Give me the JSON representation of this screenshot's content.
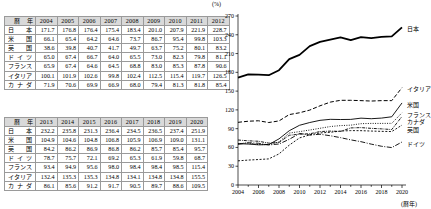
{
  "table_top": {
    "header": [
      "暦　年",
      "2004",
      "2005",
      "2006",
      "2007",
      "2008",
      "2009",
      "2010",
      "2011",
      "2012"
    ],
    "rows": [
      {
        "country": "日本",
        "values": [
          "171.7",
          "176.8",
          "176.4",
          "175.4",
          "183.4",
          "201.0",
          "207.9",
          "221.9",
          "228.7"
        ]
      },
      {
        "country": "米国",
        "values": [
          "66.1",
          "65.4",
          "64.2",
          "64.6",
          "73.7",
          "86.7",
          "95.4",
          "99.8",
          "103.3"
        ]
      },
      {
        "country": "英国",
        "values": [
          "38.6",
          "39.8",
          "40.7",
          "41.7",
          "49.7",
          "63.7",
          "75.2",
          "80.1",
          "83.2"
        ]
      },
      {
        "country": "ドイツ",
        "values": [
          "65.0",
          "67.4",
          "66.7",
          "64.0",
          "65.5",
          "73.0",
          "82.3",
          "79.8",
          "81.1"
        ]
      },
      {
        "country": "フランス",
        "values": [
          "65.9",
          "67.4",
          "64.6",
          "64.5",
          "68.8",
          "83.0",
          "85.3",
          "87.8",
          "90.6"
        ]
      },
      {
        "country": "イタリア",
        "values": [
          "100.1",
          "101.9",
          "102.6",
          "99.8",
          "102.4",
          "112.5",
          "115.4",
          "119.7",
          "126.5"
        ]
      },
      {
        "country": "カナダ",
        "values": [
          "71.9",
          "70.6",
          "69.9",
          "66.9",
          "68.0",
          "79.4",
          "81.3",
          "81.8",
          "85.4"
        ]
      }
    ]
  },
  "table_bottom": {
    "header": [
      "暦　年",
      "2013",
      "2014",
      "2015",
      "2016",
      "2017",
      "2018",
      "2019",
      "2020"
    ],
    "rows": [
      {
        "country": "日本",
        "values": [
          "232.2",
          "235.8",
          "231.3",
          "236.4",
          "234.5",
          "236.5",
          "237.4",
          "251.9"
        ]
      },
      {
        "country": "米国",
        "values": [
          "104.9",
          "104.6",
          "104.8",
          "106.8",
          "105.9",
          "106.9",
          "109.0",
          "131.1"
        ]
      },
      {
        "country": "英国",
        "values": [
          "84.2",
          "86.2",
          "86.9",
          "86.8",
          "86.2",
          "85.7",
          "85.4",
          "95.7"
        ]
      },
      {
        "country": "ドイツ",
        "values": [
          "78.7",
          "75.7",
          "72.1",
          "69.2",
          "65.3",
          "61.9",
          "59.8",
          "68.7"
        ]
      },
      {
        "country": "フランス",
        "values": [
          "93.4",
          "94.9",
          "95.6",
          "98.0",
          "98.4",
          "98.4",
          "98.5",
          "115.4"
        ]
      },
      {
        "country": "イタリア",
        "values": [
          "132.4",
          "135.3",
          "135.3",
          "134.8",
          "134.1",
          "134.8",
          "134.8",
          "155.5"
        ]
      },
      {
        "country": "カナダ",
        "values": [
          "86.1",
          "85.6",
          "91.2",
          "91.7",
          "90.5",
          "89.7",
          "88.6",
          "109.5"
        ]
      }
    ]
  },
  "chart_data": {
    "type": "line",
    "title": "",
    "xlabel": "暦年",
    "ylabel": "(%)",
    "unit_label": "(%)",
    "x_axis_note": "(暦年)",
    "x": [
      2004,
      2005,
      2006,
      2007,
      2008,
      2009,
      2010,
      2011,
      2012,
      2013,
      2014,
      2015,
      2016,
      2017,
      2018,
      2019,
      2020
    ],
    "xticks": [
      "2004",
      "2006",
      "2008",
      "2010",
      "2012",
      "2014",
      "2016",
      "2018",
      "2020"
    ],
    "yticks": [
      "0",
      "30",
      "60",
      "90",
      "120",
      "150",
      "180",
      "210",
      "240",
      "270"
    ],
    "ylim": [
      0,
      270
    ],
    "xlim": [
      2004,
      2020
    ],
    "grid": false,
    "legend_position": "right",
    "series": [
      {
        "name": "日本",
        "style": "solid-thick",
        "values": [
          171.7,
          176.8,
          176.4,
          175.4,
          183.4,
          201.0,
          207.9,
          221.9,
          228.7,
          232.2,
          235.8,
          231.3,
          236.4,
          234.5,
          236.5,
          237.4,
          251.9
        ]
      },
      {
        "name": "イタリア",
        "style": "dashed",
        "values": [
          100.1,
          101.9,
          102.6,
          99.8,
          102.4,
          112.5,
          115.4,
          119.7,
          126.5,
          132.4,
          135.3,
          135.3,
          134.8,
          134.1,
          134.8,
          134.8,
          155.5
        ]
      },
      {
        "name": "米国",
        "style": "solid-thin",
        "values": [
          66.1,
          65.4,
          64.2,
          64.6,
          73.7,
          86.7,
          95.4,
          99.8,
          103.3,
          104.9,
          104.6,
          104.8,
          106.8,
          105.9,
          106.9,
          109.0,
          131.1
        ]
      },
      {
        "name": "フランス",
        "style": "dotted",
        "values": [
          65.9,
          67.4,
          64.6,
          64.5,
          68.8,
          83.0,
          85.3,
          87.8,
          90.6,
          93.4,
          94.9,
          95.6,
          98.0,
          98.4,
          98.4,
          98.5,
          115.4
        ]
      },
      {
        "name": "カナダ",
        "style": "dash-dot-dense",
        "values": [
          71.9,
          70.6,
          69.9,
          66.9,
          68.0,
          79.4,
          81.3,
          81.8,
          85.4,
          86.1,
          85.6,
          91.2,
          91.7,
          90.5,
          89.7,
          88.6,
          109.5
        ]
      },
      {
        "name": "英国",
        "style": "short-dash",
        "values": [
          38.6,
          39.8,
          40.7,
          41.7,
          49.7,
          63.7,
          75.2,
          80.1,
          83.2,
          84.2,
          86.2,
          86.9,
          86.8,
          86.2,
          85.7,
          85.4,
          95.7
        ]
      },
      {
        "name": "ドイツ",
        "style": "dash-dot",
        "values": [
          65.0,
          67.4,
          66.7,
          64.0,
          65.5,
          73.0,
          82.3,
          79.8,
          81.1,
          78.7,
          75.7,
          72.1,
          69.2,
          65.3,
          61.9,
          59.8,
          68.7
        ]
      }
    ],
    "legend_labels": [
      "日本",
      "イタリア",
      "米国",
      "フランス",
      "カナダ",
      "英国",
      "ドイツ"
    ]
  }
}
